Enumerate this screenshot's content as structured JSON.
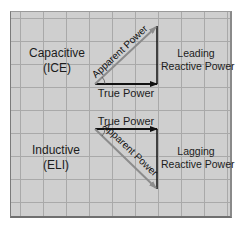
{
  "diagram": {
    "type": "power-triangle",
    "colors": {
      "background": "#cfcfcf",
      "grid": "#a9a9a9",
      "line": "#111111",
      "apparent_arrow": "#8c8c8c"
    },
    "top": {
      "left_label_line1": "Capacitive",
      "left_label_line2": "(ICE)",
      "hypotenuse_label": "Apparent Power",
      "base_label": "True Power",
      "right_label_line1": "Leading",
      "right_label_line2": "Reactive Power"
    },
    "bottom": {
      "left_label_line1": "Inductive",
      "left_label_line2": "(ELI)",
      "base_label": "True Power",
      "hypotenuse_label": "Apparent Power",
      "right_label_line1": "Lagging",
      "right_label_line2": "Reactive Power"
    }
  }
}
